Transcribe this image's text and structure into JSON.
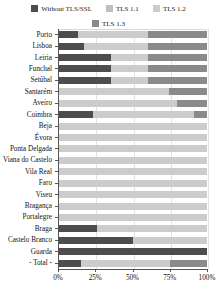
{
  "chart_data": {
    "type": "bar",
    "orientation": "horizontal",
    "stacked": true,
    "normalized_percent": true,
    "title": "",
    "xlabel": "",
    "ylabel": "",
    "xlim": [
      0,
      100
    ],
    "xticks": [
      0,
      25,
      50,
      75,
      100
    ],
    "xticklabels": [
      "0%",
      "25%",
      "50%",
      "75%",
      "100%"
    ],
    "grid": true,
    "legend_position": "top",
    "series": [
      {
        "name": "Without TLS/SSL",
        "color": "#4d4d4d",
        "values": [
          13,
          17,
          35,
          35,
          35,
          0,
          0,
          23,
          0,
          0,
          0,
          0,
          0,
          0,
          0,
          0,
          0,
          26,
          50,
          100,
          15
        ]
      },
      {
        "name": "TLS 1.1",
        "color": "#bfbfbf",
        "values": [
          0,
          0,
          0,
          0,
          0,
          0,
          0,
          0,
          0,
          0,
          0,
          0,
          0,
          0,
          0,
          0,
          0,
          0,
          0,
          0,
          0
        ]
      },
      {
        "name": "TLS 1.2",
        "color": "#cccccc",
        "values": [
          47,
          43,
          25,
          25,
          25,
          74,
          80,
          68,
          100,
          100,
          100,
          100,
          100,
          100,
          100,
          100,
          100,
          74,
          50,
          0,
          60
        ]
      },
      {
        "name": "TLS 1.3",
        "color": "#8a8a8a",
        "values": [
          40,
          40,
          40,
          40,
          40,
          26,
          20,
          9,
          0,
          0,
          0,
          0,
          0,
          0,
          0,
          0,
          0,
          0,
          0,
          0,
          25
        ]
      }
    ],
    "categories": [
      "Porto",
      "Lisboa",
      "Leiria",
      "Funchal",
      "Setúbal",
      "Santarém",
      "Aveiro",
      "Coimbra",
      "Beja",
      "Évora",
      "Ponta Delgada",
      "Viana do Castelo",
      "Vila Real",
      "Faro",
      "Viseu",
      "Bragança",
      "Portalegre",
      "Braga",
      "Castelo Branco",
      "Guarda",
      "- Total -"
    ]
  },
  "legend": {
    "items": [
      {
        "label": "Without TLS/SSL",
        "color": "#4d4d4d"
      },
      {
        "label": "TLS 1.1",
        "color": "#bfbfbf"
      },
      {
        "label": "TLS 1.2",
        "color": "#cccccc"
      },
      {
        "label": "TLS 1.3",
        "color": "#8a8a8a"
      }
    ]
  }
}
